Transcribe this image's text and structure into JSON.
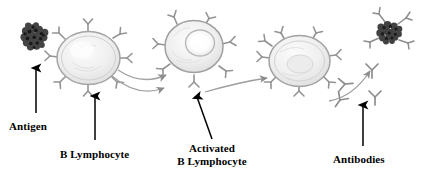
{
  "figure": {
    "background_color": "#ffffff",
    "label_color": "#000000",
    "cell_outline_color": "#9a9a9a",
    "cell_fill_color": "#efefef",
    "receptor_color": "#8f8f8f",
    "antigen_color": "#2e2e2e",
    "arrow_color_labels": "#000000",
    "arrow_color_process": "#a0a0a0"
  },
  "labels": {
    "antigen": "Antigen",
    "b_lymphocyte": "B Lymphocyte",
    "activated_line1": "Activated",
    "activated_line2": "B Lymphocyte",
    "antibodies": "Antibodies"
  },
  "elements": {
    "antigen_particle_left": "antigen-clump",
    "antigen_particle_right": "antigen-clump-bound",
    "cell_1": "b-lymphocyte-resting",
    "cell_2": "b-lymphocyte-activating",
    "cell_3": "b-lymphocyte-activated",
    "free_antibodies_count": 4,
    "process_arrows_count": 3,
    "label_arrows_count": 4
  }
}
